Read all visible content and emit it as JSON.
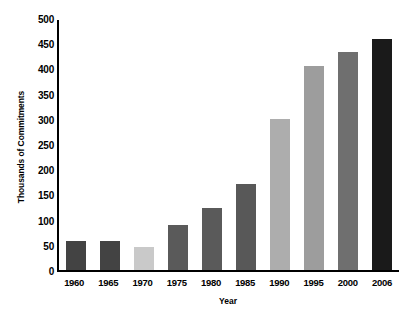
{
  "chart_data": {
    "type": "bar",
    "title": "",
    "subtitle": "",
    "xlabel": "Year",
    "ylabel": "Thousands of Commitments",
    "categories": [
      "1960",
      "1965",
      "1970",
      "1975",
      "1980",
      "1985",
      "1990",
      "1995",
      "2000",
      "2006"
    ],
    "values": [
      58,
      58,
      45,
      90,
      124,
      170,
      300,
      405,
      433,
      458
    ],
    "bar_colors": [
      "#434343",
      "#434343",
      "#c9c9c9",
      "#5a5a5a",
      "#5a5a5a",
      "#585858",
      "#adadad",
      "#9d9d9d",
      "#6f6f6f",
      "#1a1a1a"
    ],
    "ylim": [
      0,
      500
    ],
    "yticks": [
      500,
      450,
      400,
      350,
      300,
      250,
      200,
      150,
      100,
      50,
      0
    ],
    "ytick_labels": [
      "500",
      "450",
      "400",
      "350",
      "300",
      "250",
      "200",
      "150",
      "100",
      "50",
      "0"
    ],
    "grid": false,
    "legend": null,
    "legend_position": "none",
    "axis_color": "#000000",
    "background": "#ffffff"
  }
}
